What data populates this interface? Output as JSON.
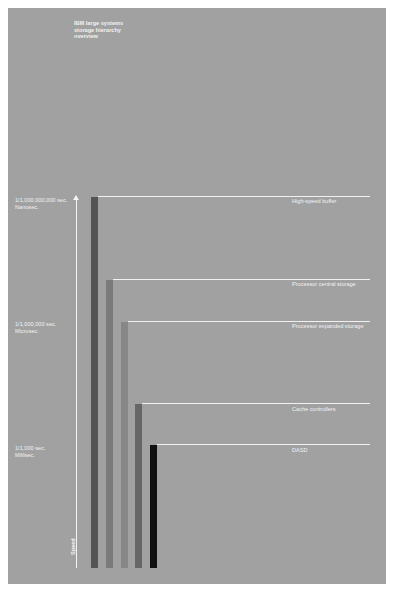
{
  "diagram": {
    "title": "IBM large systems\nstorage hierarchy\noverview",
    "axis": {
      "label": "Speed",
      "direction": "up",
      "ticks": [
        {
          "line1": "1/1,000,000,000 sec.",
          "line2": "Nanosec.",
          "top": 198
        },
        {
          "line1": "1/1,000,000 sec.",
          "line2": "Microsec.",
          "top": 321
        },
        {
          "line1": "1/1,000 sec.",
          "line2": "Millisec.",
          "top": 446
        }
      ]
    },
    "levels": [
      {
        "label": "High-speed buffer",
        "bar_left": 91,
        "top": 197,
        "color": "#555555"
      },
      {
        "label": "Processor central storage",
        "bar_left": 106,
        "top": 280,
        "color": "#7a7a7a"
      },
      {
        "label": "Processor expanded storage",
        "bar_left": 121,
        "top": 322,
        "color": "#878787"
      },
      {
        "label": "Cache controllers",
        "bar_left": 135,
        "top": 404,
        "color": "#666666"
      },
      {
        "label": "DASD",
        "bar_left": 150,
        "top": 445,
        "color": "#111111"
      }
    ],
    "colors": {
      "background": "#a1a1a1",
      "text": "#f2f2f2",
      "lines": "#f0f0f0"
    }
  }
}
